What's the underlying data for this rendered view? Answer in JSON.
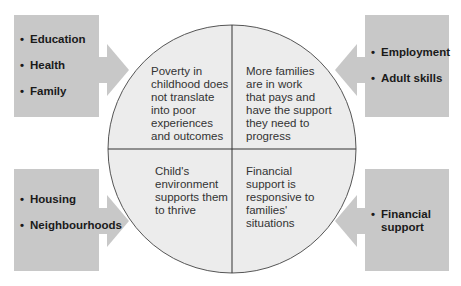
{
  "boxes": {
    "top_left": {
      "items": [
        "Education",
        "Health",
        "Family"
      ]
    },
    "top_right": {
      "items": [
        "Employment",
        "Adult skills"
      ]
    },
    "bottom_left": {
      "items": [
        "Housing",
        "Neighbourhoods"
      ]
    },
    "bottom_right": {
      "items": [
        "Financial\nsupport"
      ]
    }
  },
  "quadrants": {
    "top_left": "Poverty in\nchildhood does\nnot translate\ninto poor\nexperiences\nand outcomes",
    "top_right": "More families\nare in work\nthat pays and\nhave the support\nthey need to\nprogress",
    "bottom_left": "Child's\nenvironment\nsupports them\nto thrive",
    "bottom_right": "Financial\nsupport is\nresponsive to\nfamilies'\nsituations"
  },
  "colors": {
    "box_fill": "#c8c8c8",
    "circle_fill": "#ececec",
    "circle_stroke": "#555555"
  }
}
